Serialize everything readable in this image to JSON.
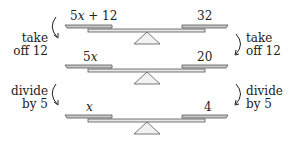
{
  "colors": {
    "pan_fill": "#c8c8c8",
    "pan_stroke": "#555555",
    "beam_fill": "#e6e6e6",
    "fulcrum_fill": "#f2f2f2",
    "text": "#222222"
  },
  "balances": [
    {
      "left": "5x + 12",
      "left_var": "x",
      "right": "32"
    },
    {
      "left": "5x",
      "left_var": "x",
      "right": "20"
    },
    {
      "left": "x",
      "left_var": "x",
      "right": "4"
    }
  ],
  "labels": {
    "b0_left_coef": "5",
    "b0_left_var": "x",
    "b0_left_rest": " + 12",
    "b0_right": "32",
    "b1_left_coef": "5",
    "b1_left_var": "x",
    "b1_right": "20",
    "b2_left_var": "x",
    "b2_right": "4"
  },
  "steps": [
    {
      "line1": "take",
      "line2": "off 12"
    },
    {
      "line1": "divide",
      "line2": "by 5"
    }
  ]
}
